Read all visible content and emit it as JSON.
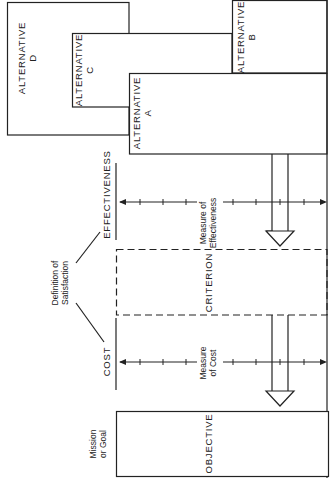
{
  "diagram": {
    "alternatives": [
      {
        "id": "A",
        "label_line1": "ALTERNATIVE",
        "label_line2": "A"
      },
      {
        "id": "B",
        "label_line1": "ALTERNATIVE",
        "label_line2": "B"
      },
      {
        "id": "C",
        "label_line1": "ALTERNATIVE",
        "label_line2": "C"
      },
      {
        "id": "D",
        "label_line1": "ALTERNATIVE",
        "label_line2": "D"
      }
    ],
    "effectiveness": {
      "label": "EFFECTIVENESS",
      "measure_line1": "Measure of",
      "measure_line2": "Effectiveness"
    },
    "criterion": {
      "label": "CRITERION"
    },
    "definition": {
      "line1": "Definition of",
      "line2": "Satisfaction"
    },
    "cost": {
      "label": "COST",
      "measure_line1": "Measure",
      "measure_line2": "of Cost"
    },
    "objective": {
      "label": "OBJECTIVE",
      "side_line1": "Mission",
      "side_line2": "or Goal"
    },
    "colors": {
      "line": "#222222",
      "background": "#ffffff"
    }
  }
}
